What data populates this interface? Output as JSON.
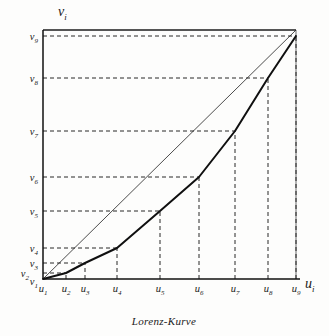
{
  "figure": {
    "caption": "Lorenz-Kurve",
    "x_axis_label": "u",
    "x_axis_label_sub": "i",
    "y_axis_label": "v",
    "y_axis_label_sub": "i"
  },
  "chart_data": {
    "type": "line",
    "title": "Lorenz-Kurve",
    "xlabel": "u_i",
    "ylabel": "v_i",
    "grid": true,
    "legend": false,
    "xlim": [
      0,
      1
    ],
    "ylim": [
      0,
      1
    ],
    "x_tick_labels": [
      "u_1",
      "u_2",
      "u_3",
      "u_4",
      "u_5",
      "u_6",
      "u_7",
      "u_8",
      "u_9"
    ],
    "y_tick_labels": [
      "v_1",
      "v_2",
      "v_3",
      "v_4",
      "v_5",
      "v_6",
      "v_7",
      "v_8",
      "v_9"
    ],
    "x_tick_base": [
      "u",
      "u",
      "u",
      "u",
      "u",
      "u",
      "u",
      "u",
      "u"
    ],
    "x_tick_subs": [
      "1",
      "2",
      "3",
      "4",
      "5",
      "6",
      "7",
      "8",
      "9"
    ],
    "y_tick_base": [
      "v",
      "v",
      "v",
      "v",
      "v",
      "v",
      "v",
      "v",
      "v"
    ],
    "y_tick_subs": [
      "1",
      "2",
      "3",
      "4",
      "5",
      "6",
      "7",
      "8",
      "9"
    ],
    "x_tick_values": [
      0.0,
      0.091,
      0.166,
      0.292,
      0.462,
      0.617,
      0.759,
      0.889,
      1.0
    ],
    "y_tick_values": [
      0.0,
      0.024,
      0.065,
      0.125,
      0.272,
      0.408,
      0.592,
      0.8,
      1.0
    ],
    "series": [
      {
        "name": "Lorenz-Kurve",
        "kind": "lorenz-curve",
        "color": "#101010",
        "width": 2.0,
        "x": [
          0.0,
          0.091,
          0.166,
          0.292,
          0.462,
          0.617,
          0.759,
          0.889,
          1.0
        ],
        "y": [
          0.0,
          0.024,
          0.065,
          0.125,
          0.272,
          0.408,
          0.592,
          0.8,
          1.0
        ]
      },
      {
        "name": "Gleichverteilungsgerade",
        "kind": "diagonal",
        "color": "#202020",
        "width": 0.8,
        "x": [
          0.0,
          1.0
        ],
        "y": [
          0.0,
          1.0
        ]
      }
    ],
    "annotations": []
  },
  "geometry": {
    "plot_left": 43,
    "plot_right": 296,
    "plot_top": 30,
    "plot_bottom": 279,
    "x_ticks_px": [
      43,
      66,
      85,
      117,
      160,
      199,
      235,
      268,
      296
    ],
    "y_ticks_px": [
      279,
      273,
      263,
      248,
      211,
      177,
      131,
      78,
      36
    ]
  }
}
